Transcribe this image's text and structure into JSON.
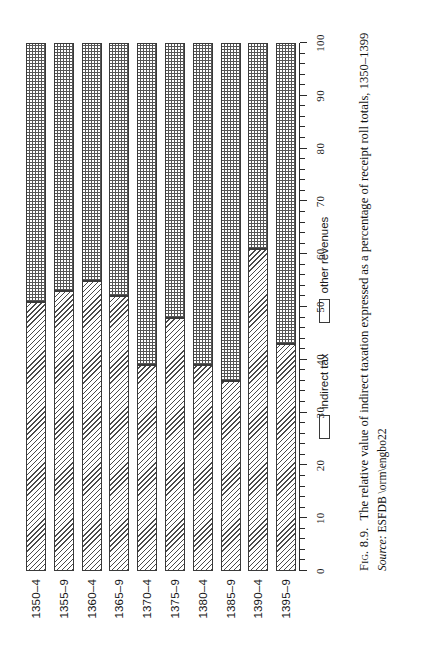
{
  "figure": {
    "number": "Fig. 8.9.",
    "caption": "The relative value of indirect taxation expressed as a percentage of receipt roll totals, 1350–1399",
    "source_label": "Source:",
    "source_value": "ESFDB \\orm\\engbo22"
  },
  "legend": {
    "position": "below-axis",
    "items": [
      {
        "label": "indirect tax",
        "pattern": "hatch"
      },
      {
        "label": "other revenues",
        "pattern": "dots"
      }
    ]
  },
  "chart_data": {
    "type": "bar",
    "orientation": "horizontal-stacked",
    "title": "The relative value of indirect taxation expressed as a percentage of receipt roll totals, 1350–1399",
    "xlabel": "",
    "ylabel": "",
    "xlim": [
      0,
      100
    ],
    "grid": false,
    "minor_tick_step": 2,
    "major_tick_step": 10,
    "tick_labels": [
      "0",
      "10",
      "20",
      "30",
      "40",
      "50",
      "60",
      "70",
      "80",
      "90",
      "100"
    ],
    "categories": [
      "1350–4",
      "1355–9",
      "1360–4",
      "1365–9",
      "1370–4",
      "1375–9",
      "1380–4",
      "1385–9",
      "1390–4",
      "1395–9"
    ],
    "series": [
      {
        "name": "indirect tax",
        "pattern": "hatch",
        "values": [
          51,
          53,
          55,
          52,
          39,
          48,
          39,
          36,
          61,
          43
        ]
      },
      {
        "name": "other revenues",
        "pattern": "dots",
        "values": [
          49,
          47,
          45,
          48,
          61,
          52,
          61,
          64,
          39,
          57
        ]
      }
    ]
  }
}
